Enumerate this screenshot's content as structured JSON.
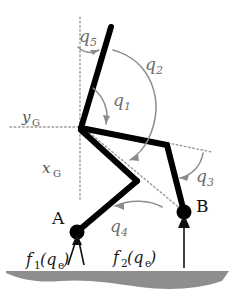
{
  "figure": {
    "background_color": "#ffffff",
    "ground_color": "#8e8e8e",
    "link_color": "#000000",
    "annotation_color": "#8c8c8c"
  },
  "labels": {
    "q5": "q",
    "q5_sub": "5",
    "q1": "q",
    "q1_sub": "1",
    "q2": "q",
    "q2_sub": "2",
    "q3": "q",
    "q3_sub": "3",
    "q4": "q",
    "q4_sub": "4",
    "yG": "y",
    "yG_sub": "G",
    "xG": "x",
    "xG_sub": "G",
    "point_a": "A",
    "point_b": "B",
    "f1": "f",
    "f1_sub": "1",
    "f1_arg_open": "(q",
    "f1_arg_sub": "e",
    "f1_arg_close": ")",
    "f2": "f",
    "f2_sub": "2",
    "f2_arg_open": "(q",
    "f2_arg_sub": "e",
    "f2_arg_close": ")"
  }
}
